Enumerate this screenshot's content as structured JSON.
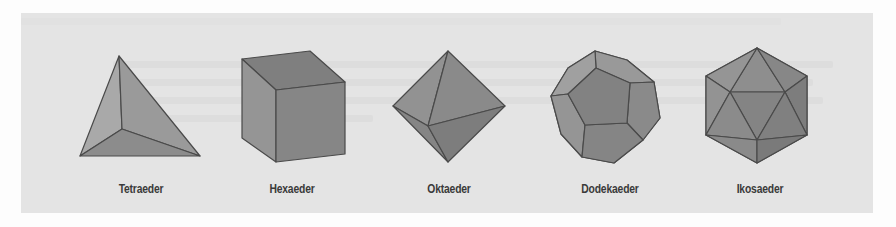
{
  "figure": {
    "panel_color": "#e4e4e4",
    "edge_color": "#4a4a4a",
    "solids": [
      {
        "id": "tetrahedron",
        "label": "Tetraeder",
        "center_x": 141
      },
      {
        "id": "hexahedron",
        "label": "Hexaeder",
        "center_x": 292
      },
      {
        "id": "octahedron",
        "label": "Oktaeder",
        "center_x": 449
      },
      {
        "id": "dodecahedron",
        "label": "Dodekaeder",
        "center_x": 610
      },
      {
        "id": "icosahedron",
        "label": "Ikosaeder",
        "center_x": 760
      }
    ]
  }
}
